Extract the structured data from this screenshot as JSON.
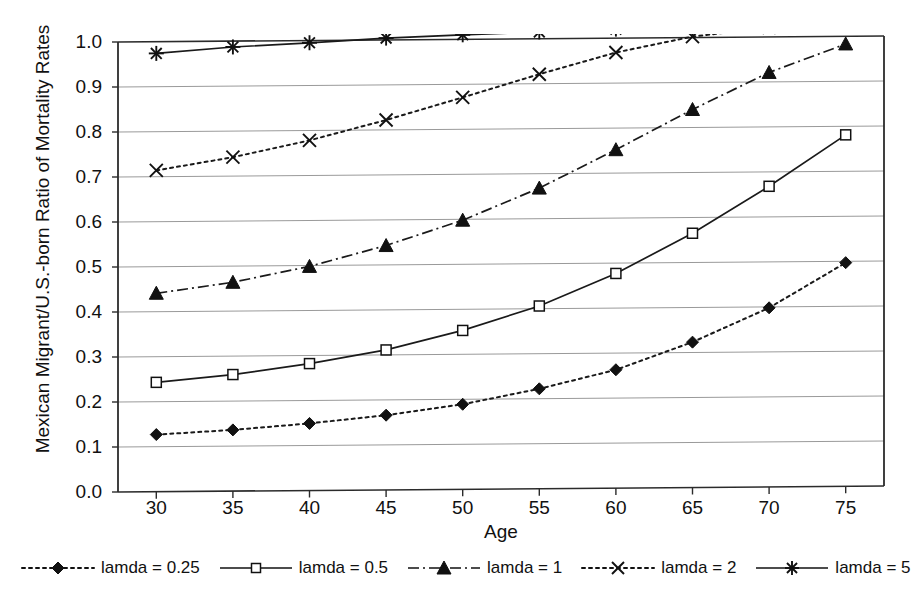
{
  "chart_data": {
    "type": "line",
    "title": "",
    "xlabel": "Age",
    "ylabel": "Mexican Migrant/U.S.-born Ratio of Mortality Rates",
    "x": [
      30,
      35,
      40,
      45,
      50,
      55,
      60,
      65,
      70,
      75
    ],
    "xtick_labels": [
      "30",
      "35",
      "40",
      "45",
      "50",
      "55",
      "60",
      "65",
      "70",
      "75"
    ],
    "ytick_labels": [
      "0.0",
      "0.1",
      "0.2",
      "0.3",
      "0.4",
      "0.5",
      "0.6",
      "0.7",
      "0.8",
      "0.9",
      "1.0"
    ],
    "ytick_values": [
      0.0,
      0.1,
      0.2,
      0.3,
      0.4,
      0.5,
      0.6,
      0.7,
      0.8,
      0.9,
      1.0
    ],
    "xlim": [
      27.5,
      77.5
    ],
    "ylim": [
      0.0,
      1.0
    ],
    "grid": "horizontal",
    "legend_position": "bottom",
    "line_color": "#1a1a1a",
    "grid_color": "#9a9a9a",
    "series": [
      {
        "name": "lamda = 0.25",
        "marker": "filled-diamond",
        "dash": "dotted",
        "values": [
          0.127,
          0.136,
          0.149,
          0.166,
          0.189,
          0.222,
          0.263,
          0.323,
          0.398,
          0.497
        ]
      },
      {
        "name": "lamda = 0.5",
        "marker": "open-square",
        "dash": "solid",
        "values": [
          0.243,
          0.259,
          0.282,
          0.311,
          0.353,
          0.406,
          0.477,
          0.565,
          0.668,
          0.781
        ]
      },
      {
        "name": "lamda = 1",
        "marker": "filled-triangle",
        "dash": "dash-dot",
        "values": [
          0.441,
          0.464,
          0.498,
          0.543,
          0.598,
          0.668,
          0.752,
          0.84,
          0.921,
          0.983
        ]
      },
      {
        "name": "lamda = 2",
        "marker": "cross-x",
        "dash": "dotted",
        "values": [
          0.714,
          0.742,
          0.778,
          0.822,
          0.871,
          0.921,
          0.968,
          1.002,
          1.021,
          1.028
        ]
      },
      {
        "name": "lamda = 5",
        "marker": "asterisk-star",
        "dash": "solid",
        "values": [
          0.974,
          0.987,
          0.995,
          1.004,
          1.01,
          1.015,
          1.02,
          1.022,
          1.025,
          1.028
        ]
      }
    ]
  },
  "legend": {
    "items": [
      {
        "label": "lamda = 0.25",
        "marker": "filled-diamond",
        "dash": "dotted"
      },
      {
        "label": "lamda = 0.5",
        "marker": "open-square",
        "dash": "solid"
      },
      {
        "label": "lamda = 1",
        "marker": "filled-triangle",
        "dash": "dash-dot"
      },
      {
        "label": "lamda = 2",
        "marker": "cross-x",
        "dash": "dotted"
      },
      {
        "label": "lamda = 5",
        "marker": "asterisk-star",
        "dash": "solid"
      }
    ]
  }
}
